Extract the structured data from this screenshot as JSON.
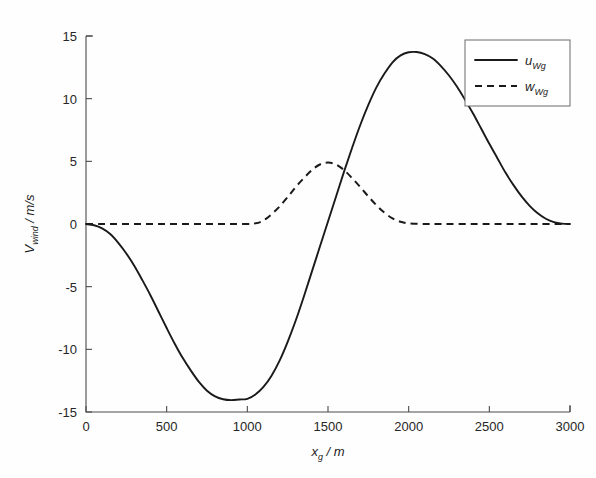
{
  "chart_data": {
    "type": "line",
    "title": "",
    "xlabel": "x_g / m",
    "xlabel_base": "x",
    "xlabel_sub": "g",
    "xlabel_unit": "/ m",
    "ylabel": "V_wind / m/s",
    "ylabel_base": "V",
    "ylabel_sub": "wind",
    "ylabel_unit": "/ m/s",
    "xlim": [
      0,
      3000
    ],
    "ylim": [
      -15,
      15
    ],
    "xticks": [
      0,
      500,
      1000,
      1500,
      2000,
      2500,
      3000
    ],
    "xtick_labels": [
      "0",
      "500",
      "1000",
      "1500",
      "2000",
      "2500",
      "3000"
    ],
    "yticks": [
      15,
      10,
      5,
      0,
      -5,
      -10,
      -15
    ],
    "ytick_labels": [
      "15",
      "10",
      "5",
      "0",
      "-5",
      "-10",
      "-15"
    ],
    "grid": false,
    "legend_position": "top-right",
    "axis_style": "left-bottom-only",
    "series": [
      {
        "name": "u_Wg",
        "name_base": "u",
        "name_sub": "Wg",
        "style": "solid",
        "color": "#1a1a1a",
        "x": [
          0,
          50,
          100,
          150,
          200,
          250,
          300,
          350,
          400,
          450,
          500,
          550,
          600,
          650,
          700,
          750,
          800,
          850,
          900,
          950,
          1000,
          1050,
          1100,
          1150,
          1200,
          1250,
          1300,
          1350,
          1400,
          1450,
          1500,
          1550,
          1600,
          1650,
          1700,
          1750,
          1800,
          1850,
          1900,
          1950,
          2000,
          2050,
          2100,
          2150,
          2200,
          2250,
          2300,
          2350,
          2400,
          2450,
          2500,
          2550,
          2600,
          2650,
          2700,
          2750,
          2800,
          2850,
          2900,
          2950,
          3000
        ],
        "y": [
          0.0,
          -0.1,
          -0.35,
          -0.8,
          -1.5,
          -2.35,
          -3.35,
          -4.5,
          -5.7,
          -7.0,
          -8.3,
          -9.55,
          -10.7,
          -11.7,
          -12.6,
          -13.3,
          -13.75,
          -13.98,
          -14.05,
          -14.0,
          -13.95,
          -13.6,
          -13.0,
          -12.1,
          -10.9,
          -9.4,
          -7.7,
          -5.8,
          -3.8,
          -1.8,
          0.2,
          2.2,
          4.2,
          6.1,
          7.9,
          9.5,
          10.9,
          12.0,
          12.9,
          13.45,
          13.7,
          13.72,
          13.55,
          13.2,
          12.6,
          11.85,
          10.95,
          9.9,
          8.8,
          7.6,
          6.4,
          5.25,
          4.1,
          3.1,
          2.2,
          1.45,
          0.85,
          0.42,
          0.15,
          0.03,
          0.0
        ]
      },
      {
        "name": "w_Wg",
        "name_base": "w",
        "name_sub": "Wg",
        "style": "dashed",
        "color": "#1a1a1a",
        "x": [
          0,
          100,
          200,
          300,
          400,
          500,
          600,
          700,
          800,
          900,
          1000,
          1050,
          1080,
          1120,
          1160,
          1200,
          1250,
          1300,
          1350,
          1400,
          1450,
          1500,
          1550,
          1600,
          1650,
          1700,
          1750,
          1800,
          1850,
          1900,
          1950,
          2000,
          2100,
          2200,
          2400,
          2600,
          2800,
          3000
        ],
        "y": [
          0.0,
          0.0,
          0.0,
          0.0,
          0.0,
          0.0,
          0.0,
          0.0,
          0.0,
          0.0,
          0.0,
          0.05,
          0.15,
          0.45,
          0.9,
          1.4,
          2.15,
          2.95,
          3.65,
          4.3,
          4.75,
          4.9,
          4.75,
          4.3,
          3.65,
          2.95,
          2.2,
          1.5,
          0.9,
          0.45,
          0.18,
          0.05,
          0.0,
          0.0,
          0.0,
          0.0,
          0.0,
          0.0
        ]
      }
    ],
    "annotations": []
  },
  "legend": {
    "entries": [
      {
        "label_base": "u",
        "label_sub": "Wg",
        "style": "solid"
      },
      {
        "label_base": "w",
        "label_sub": "Wg",
        "style": "dashed"
      }
    ]
  }
}
